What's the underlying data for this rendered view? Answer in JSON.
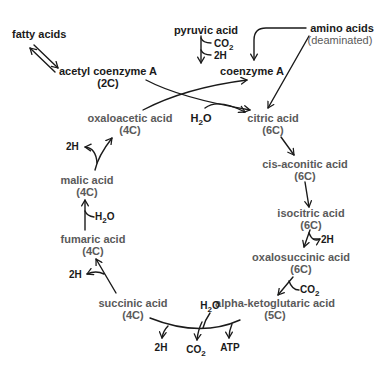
{
  "diagram": {
    "inputs": {
      "fatty_acids": "fatty acids",
      "pyruvic_acid": "pyruvic acid",
      "amino_acids": "amino acids",
      "amino_acids_note": "(deaminated)",
      "acetyl_coa": "acetyl coenzyme A",
      "acetyl_coa_c": "(2C)",
      "coenzyme_a": "coenzyme A",
      "pyruvic_co2": "CO",
      "pyruvic_2h": "2H"
    },
    "cycle": [
      {
        "name": "citric acid",
        "carbons": "(6C)"
      },
      {
        "name": "cis-aconitic acid",
        "carbons": "(6C)"
      },
      {
        "name": "isocitric acid",
        "carbons": "(6C)"
      },
      {
        "name": "oxalosuccinic acid",
        "carbons": "(6C)"
      },
      {
        "name": "alpha-ketoglutaric acid",
        "carbons": "(5C)"
      },
      {
        "name": "succinic acid",
        "carbons": "(4C)"
      },
      {
        "name": "fumaric acid",
        "carbons": "(4C)"
      },
      {
        "name": "malic acid",
        "carbons": "(4C)"
      },
      {
        "name": "oxaloacetic acid",
        "carbons": "(4C)"
      }
    ],
    "byproducts": {
      "h2o_citric": "H",
      "isocitric_2h": "2H",
      "oxalosuccinic_co2": "CO",
      "akg_h2o": "H",
      "akg_2h": "2H",
      "akg_co2": "CO",
      "akg_atp": "ATP",
      "succinic_2h": "2H",
      "fumaric_h2o": "H",
      "malic_2h": "2H"
    },
    "subscript_2": "2",
    "oxygen": "O"
  }
}
